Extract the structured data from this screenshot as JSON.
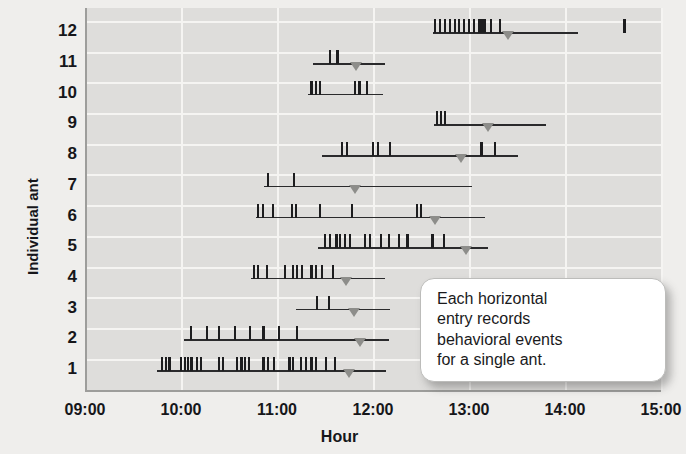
{
  "figure": {
    "background_color": "#efeeec",
    "plot_background_color": "#dedddb",
    "gridline_color": "#f5f4f2",
    "axis_color": "#9d9d9b",
    "event_color": "#1d1d1f",
    "marker_color": "#8d8d8a"
  },
  "callout": {
    "text": "Each horizontal entry records behavioral events for a single ant.",
    "lines": [
      "Each horizontal",
      "entry records",
      "behavioral events",
      "for a single ant."
    ]
  },
  "chart_data": {
    "type": "scatter",
    "title": "",
    "xlabel": "Hour",
    "ylabel": "Individual ant",
    "xlim": [
      9,
      15
    ],
    "ylim": [
      0.5,
      12.5
    ],
    "grid": true,
    "legend": null,
    "xticks": [
      "09:00",
      "10:00",
      "11:00",
      "12:00",
      "13:00",
      "14:00",
      "15:00"
    ],
    "xtick_values": [
      9,
      10,
      11,
      12,
      13,
      14,
      15
    ],
    "yticks": [
      "1",
      "2",
      "3",
      "4",
      "5",
      "6",
      "7",
      "8",
      "9",
      "10",
      "11",
      "12"
    ],
    "ytick_values": [
      1,
      2,
      3,
      4,
      5,
      6,
      7,
      8,
      9,
      10,
      11,
      12
    ],
    "series_description": "Each row is one ant; the horizontal line spans that ant's observation window, vertical ticks mark behavioral events, and the grey triangle marks a single highlighted time point.",
    "rows": [
      {
        "ant": 12,
        "start": 12.62,
        "end": 14.14,
        "marker": 13.41,
        "events": [
          12.65,
          12.7,
          12.75,
          12.8,
          12.85,
          12.9,
          12.95,
          13.0,
          13.05,
          13.11,
          13.14,
          13.17,
          13.23,
          13.32,
          14.62
        ]
      },
      {
        "ant": 11,
        "start": 11.38,
        "end": 12.13,
        "marker": 11.82,
        "events": [
          11.55,
          11.63
        ]
      },
      {
        "ant": 10,
        "start": 11.32,
        "end": 12.1,
        "marker": null,
        "events": [
          11.36,
          11.41,
          11.45,
          11.81,
          11.86,
          11.94
        ]
      },
      {
        "ant": 9,
        "start": 12.64,
        "end": 13.8,
        "marker": 13.2,
        "events": [
          12.67,
          12.71,
          12.75
        ]
      },
      {
        "ant": 8,
        "start": 11.47,
        "end": 13.51,
        "marker": 12.92,
        "events": [
          11.68,
          11.73,
          12.0,
          12.05,
          12.18,
          13.13,
          13.27
        ]
      },
      {
        "ant": 7,
        "start": 10.86,
        "end": 13.03,
        "marker": 11.81,
        "events": [
          10.91,
          11.18
        ]
      },
      {
        "ant": 6,
        "start": 10.78,
        "end": 13.17,
        "marker": 12.65,
        "events": [
          10.8,
          10.85,
          10.96,
          11.16,
          11.2,
          11.45,
          11.78,
          12.46,
          12.5
        ]
      },
      {
        "ant": 5,
        "start": 11.43,
        "end": 13.2,
        "marker": 12.97,
        "events": [
          11.5,
          11.55,
          11.62,
          11.66,
          11.71,
          11.76,
          11.92,
          11.97,
          12.08,
          12.17,
          12.27,
          12.36,
          12.62,
          12.74
        ]
      },
      {
        "ant": 4,
        "start": 10.73,
        "end": 12.13,
        "marker": 11.72,
        "events": [
          10.76,
          10.8,
          10.9,
          11.08,
          11.17,
          11.21,
          11.26,
          11.36,
          11.41,
          11.47,
          11.58
        ]
      },
      {
        "ant": 3,
        "start": 11.2,
        "end": 12.18,
        "marker": 11.8,
        "events": [
          11.42,
          11.54
        ]
      },
      {
        "ant": 2,
        "start": 10.03,
        "end": 12.17,
        "marker": 11.86,
        "events": [
          10.1,
          10.27,
          10.4,
          10.56,
          10.72,
          10.86,
          11.02,
          11.21
        ]
      },
      {
        "ant": 1,
        "start": 9.75,
        "end": 12.14,
        "marker": 11.75,
        "events": [
          9.8,
          9.84,
          9.88,
          10.0,
          10.04,
          10.07,
          10.11,
          10.17,
          10.21,
          10.4,
          10.44,
          10.58,
          10.63,
          10.67,
          10.71,
          10.86,
          10.91,
          10.97,
          11.13,
          11.17,
          11.25,
          11.3,
          11.36,
          11.41,
          11.51,
          11.6
        ]
      }
    ]
  }
}
